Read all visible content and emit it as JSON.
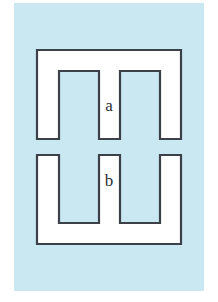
{
  "figure": {
    "background_color": "#c9e8f2",
    "piece_fill_color": "#ffffff",
    "piece_stroke_color": "#3b4049",
    "panel": {
      "x": 14,
      "y": 3,
      "width": 190,
      "height": 288
    },
    "pieces": [
      {
        "id": "piece-a",
        "label": "a",
        "label_x": 109,
        "label_y": 107,
        "description": "upper comb piece with two downward notches",
        "points": "37,50 181,50 181,139 160,139 160,71 120,71 120,139 99,139 99,71 59,71 59,139 37,139"
      },
      {
        "id": "piece-b",
        "label": "b",
        "label_x": 109,
        "label_y": 182,
        "description": "lower comb piece with two upward notches",
        "points": "37,155 59,155 59,223 99,223 99,155 120,155 120,223 160,223 160,155 181,155 181,244 37,244"
      }
    ]
  }
}
